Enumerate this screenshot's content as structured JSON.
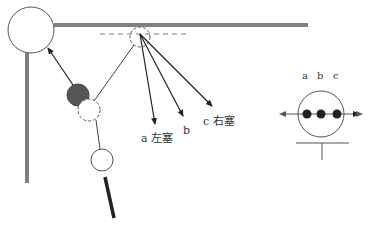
{
  "diagram": {
    "type": "pendulum-collision-schematic",
    "colors": {
      "frame": "#808080",
      "line": "#333333",
      "filled_ball": "#555555",
      "rod": "#222222",
      "background": "#ffffff"
    },
    "labels": {
      "arrow_a": "a 左塞",
      "arrow_b": "b",
      "arrow_c": "c 右塞",
      "dot_a": "a",
      "dot_b": "b",
      "dot_c": "c"
    }
  }
}
